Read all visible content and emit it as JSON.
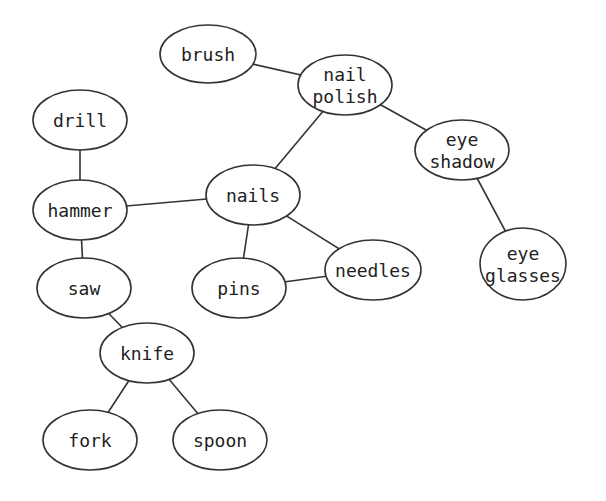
{
  "diagram": {
    "type": "undirected-graph",
    "style": {
      "stroke": "#333333",
      "fill": "#ffffff",
      "text": "#222222"
    },
    "nodes": [
      {
        "id": "brush",
        "lines": [
          "brush"
        ],
        "cx": 208,
        "cy": 54,
        "rx": 48,
        "ry": 29
      },
      {
        "id": "nail_polish",
        "lines": [
          "nail",
          "polish"
        ],
        "cx": 345,
        "cy": 85,
        "rx": 47,
        "ry": 30
      },
      {
        "id": "eye_shadow",
        "lines": [
          "eye",
          "shadow"
        ],
        "cx": 462,
        "cy": 150,
        "rx": 47,
        "ry": 30
      },
      {
        "id": "eye_glasses",
        "lines": [
          "eye",
          "glasses"
        ],
        "cx": 523,
        "cy": 264,
        "rx": 43,
        "ry": 36
      },
      {
        "id": "drill",
        "lines": [
          "drill"
        ],
        "cx": 80,
        "cy": 120,
        "rx": 47,
        "ry": 30
      },
      {
        "id": "hammer",
        "lines": [
          "hammer"
        ],
        "cx": 80,
        "cy": 210,
        "rx": 47,
        "ry": 30
      },
      {
        "id": "nails",
        "lines": [
          "nails"
        ],
        "cx": 253,
        "cy": 195,
        "rx": 47,
        "ry": 30
      },
      {
        "id": "saw",
        "lines": [
          "saw"
        ],
        "cx": 84,
        "cy": 288,
        "rx": 47,
        "ry": 30
      },
      {
        "id": "pins",
        "lines": [
          "pins"
        ],
        "cx": 239,
        "cy": 288,
        "rx": 47,
        "ry": 30
      },
      {
        "id": "needles",
        "lines": [
          "needles"
        ],
        "cx": 373,
        "cy": 270,
        "rx": 48,
        "ry": 30
      },
      {
        "id": "knife",
        "lines": [
          "knife"
        ],
        "cx": 147,
        "cy": 353,
        "rx": 47,
        "ry": 30
      },
      {
        "id": "fork",
        "lines": [
          "fork"
        ],
        "cx": 90,
        "cy": 440,
        "rx": 47,
        "ry": 30
      },
      {
        "id": "spoon",
        "lines": [
          "spoon"
        ],
        "cx": 220,
        "cy": 440,
        "rx": 47,
        "ry": 30
      }
    ],
    "edges": [
      [
        "brush",
        "nail_polish"
      ],
      [
        "nail_polish",
        "eye_shadow"
      ],
      [
        "nail_polish",
        "nails"
      ],
      [
        "eye_shadow",
        "eye_glasses"
      ],
      [
        "drill",
        "hammer"
      ],
      [
        "hammer",
        "nails"
      ],
      [
        "hammer",
        "saw"
      ],
      [
        "nails",
        "pins"
      ],
      [
        "nails",
        "needles"
      ],
      [
        "pins",
        "needles"
      ],
      [
        "saw",
        "knife"
      ],
      [
        "knife",
        "fork"
      ],
      [
        "knife",
        "spoon"
      ]
    ]
  }
}
